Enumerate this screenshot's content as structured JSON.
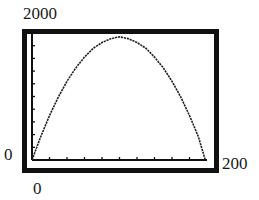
{
  "window": {
    "ymax_label": "2000",
    "ymin_label": "0",
    "xmin_label": "0",
    "xmax_label": "200"
  },
  "chart_data": {
    "type": "line",
    "title": "",
    "xlabel": "",
    "ylabel": "",
    "xlim": [
      0,
      200
    ],
    "ylim": [
      0,
      2000
    ],
    "x_tick_step": 20,
    "y_tick_step": 200,
    "grid": false,
    "legend": null,
    "series": [
      {
        "name": "curve",
        "x": [
          0,
          10,
          20,
          30,
          40,
          50,
          60,
          70,
          80,
          90,
          100,
          110,
          120,
          130,
          140,
          150,
          160,
          170,
          180,
          190,
          198
        ],
        "y": [
          0,
          370,
          700,
          990,
          1240,
          1450,
          1620,
          1760,
          1850,
          1910,
          1940,
          1910,
          1850,
          1760,
          1620,
          1450,
          1240,
          990,
          700,
          370,
          0
        ]
      }
    ],
    "frame_color": "#111111",
    "line_color": "#222222"
  }
}
